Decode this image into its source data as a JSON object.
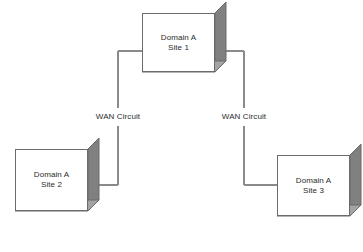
{
  "diagram": {
    "background": "#ffffff",
    "line_color": "#8a8a8a",
    "box_border_color": "#6b6b6b",
    "box_fill_color": "#ffffff",
    "shadow_side_color": "#808080",
    "shadow_bottom_color": "#a3a3a3",
    "text_color": "#2b2b2b"
  },
  "nodes": [
    {
      "id": "site1",
      "name": "site-1",
      "line1": "Domain A",
      "line2": "Site 1",
      "x": 142,
      "y": 13,
      "width": 73,
      "height": 59,
      "depth": 11
    },
    {
      "id": "site2",
      "name": "site-2",
      "line1": "Domain A",
      "line2": "Site 2",
      "x": 15,
      "y": 149,
      "width": 73,
      "height": 62,
      "depth": 11
    },
    {
      "id": "site3",
      "name": "site-3",
      "line1": "Domain A",
      "line2": "Site 3",
      "x": 277,
      "y": 155,
      "width": 73,
      "height": 61,
      "depth": 11
    }
  ],
  "links": [
    {
      "id": "link-site1-site2",
      "name": "wan-circuit-site1-site2",
      "label": "WAN Circuit",
      "from": "site1",
      "to": "site2",
      "label_x": 118,
      "label_y": 117,
      "segments": [
        "M 142 51 L 118 51",
        "M 118 51 L 118 108",
        "M 118 126 L 118 185",
        "M 118 185 L 88 185"
      ]
    },
    {
      "id": "link-site1-site3",
      "name": "wan-circuit-site1-site3",
      "label": "WAN Circuit",
      "from": "site1",
      "to": "site3",
      "label_x": 244,
      "label_y": 117,
      "segments": [
        "M 226 51 L 244 51",
        "M 244 51 L 244 108",
        "M 244 126 L 244 185",
        "M 244 185 L 277 185"
      ]
    }
  ]
}
